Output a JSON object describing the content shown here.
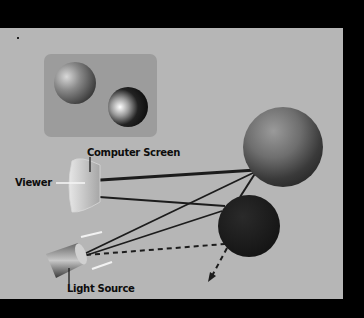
{
  "diagram": {
    "labels": {
      "computer_screen": "Computer Screen",
      "viewer": "Viewer",
      "light_source": "Light Source"
    },
    "colors": {
      "background": "#000000",
      "panel": "#b6b6b6",
      "inset_screen": "#9c9c9c",
      "ray": "#1c1c1c",
      "dark_sphere": "#1a1a1a"
    },
    "elements": {
      "inset": "rendered-image-of-two-spheres",
      "large_sphere": "shaded-gray-sphere",
      "small_sphere": "dark-sphere",
      "eye_ray": "viewer-to-screen-to-sphere",
      "light_rays": "light-to-spheres",
      "shadow_ray": "dashed-reflected-ray"
    }
  }
}
